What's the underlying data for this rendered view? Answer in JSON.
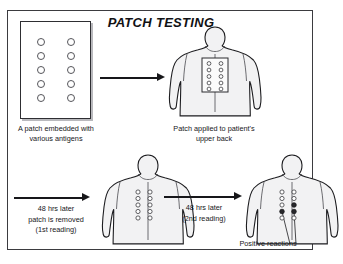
{
  "diagram": {
    "title": "PATCH TESTING",
    "frame_color": "#3b3b3f",
    "background": "#ffffff"
  },
  "steps": [
    {
      "id": "patch",
      "caption": "A patch embedded with various antigens",
      "patch": {
        "rows": 5,
        "cols": 2,
        "dot_state": "open"
      }
    },
    {
      "id": "applied",
      "caption": "Patch applied to patient's upper back",
      "patch": {
        "rows": 5,
        "cols": 2,
        "dot_state": "open",
        "on_body": true
      }
    },
    {
      "id": "removed",
      "caption": "",
      "patch": {
        "rows": 5,
        "cols": 2,
        "dot_state": "open",
        "on_body": true,
        "patch_removed": true
      }
    },
    {
      "id": "positive",
      "caption": "Positive reactions",
      "patch": {
        "rows": 5,
        "cols": 2,
        "dot_state": "mixed",
        "positive_count": 3
      }
    }
  ],
  "arrows": [
    {
      "id": "arrow-1",
      "label": ""
    },
    {
      "id": "arrow-2",
      "label": "48 hrs later\npatch is removed\n(1st reading)"
    },
    {
      "id": "arrow-3",
      "label": "48 hrs later\n(2nd reading)"
    }
  ],
  "labels": {
    "arrow_2_line_1": "48 hrs later",
    "arrow_2_line_2": "patch is removed",
    "arrow_2_line_3": "(1st reading)",
    "arrow_3_line_1": "48 hrs later",
    "arrow_3_line_2": "(2nd reading)"
  },
  "captions": {
    "patch_line_1": "A patch embedded with",
    "patch_line_2": "various antigens",
    "applied_line_1": "Patch applied to patient's",
    "applied_line_2": "upper back",
    "positive": "Positive reactions"
  },
  "colors": {
    "ink": "#17171a",
    "body_fill": "#f2f2f3",
    "body_outline": "#1d1d20",
    "dot_open": "#ffffff",
    "dot_positive": "#27272b"
  }
}
